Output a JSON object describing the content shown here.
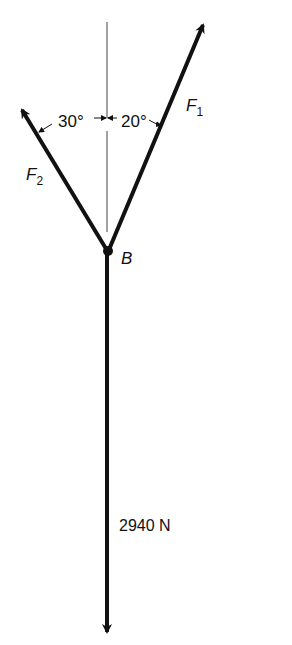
{
  "diagram": {
    "point_label": "B",
    "forces": {
      "f1": {
        "symbol": "F",
        "subscript": "1",
        "angle_label": "20°"
      },
      "f2": {
        "symbol": "F",
        "subscript": "2",
        "angle_label": "30°"
      },
      "weight": {
        "label": "2940 N"
      }
    },
    "colors": {
      "ink": "#111111",
      "reference_line": "#444444",
      "background": "#ffffff"
    }
  }
}
